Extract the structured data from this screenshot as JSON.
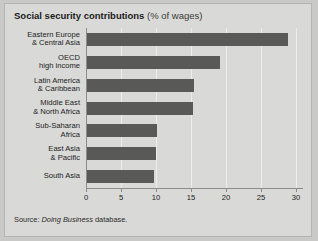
{
  "chart": {
    "title_main": "Social security contributions",
    "title_sub": "(% of wages)",
    "source_prefix": "Source: ",
    "source_italic": "Doing Business",
    "source_suffix": " database."
  },
  "chart_data": {
    "type": "bar",
    "orientation": "horizontal",
    "title": "Social security contributions (% of wages)",
    "xlabel": "",
    "ylabel": "",
    "xlim": [
      0,
      31
    ],
    "grid": true,
    "legend": "none",
    "categories": [
      "Eastern Europe & Central Asia",
      "OECD high income",
      "Latin America & Caribbean",
      "Middle East & North Africa",
      "Sub-Saharan Africa",
      "East Asia & Pacific",
      "South Asia"
    ],
    "category_lines": [
      [
        "Eastern Europe",
        "& Central Asia"
      ],
      [
        "OECD",
        "high income"
      ],
      [
        "Latin America",
        "& Caribbean"
      ],
      [
        "Middle East",
        "& North Africa"
      ],
      [
        "Sub-Saharan",
        "Africa"
      ],
      [
        "East Asia",
        "& Pacific"
      ],
      [
        "South Asia"
      ]
    ],
    "values": [
      28.8,
      19.2,
      15.4,
      15.3,
      10.2,
      10.0,
      9.7
    ],
    "ticks": [
      0,
      5,
      10,
      15,
      20,
      25,
      30
    ],
    "tick_labels": [
      "0",
      "5",
      "10",
      "15",
      "20",
      "25",
      "30"
    ],
    "bar_color": "#595957",
    "panel_color": "#d9d9d7",
    "grid_color": "#ededeb",
    "axis_color": "#8c8c8a"
  }
}
